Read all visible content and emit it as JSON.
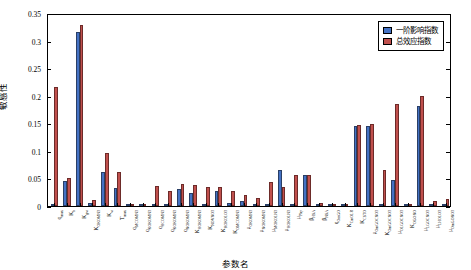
{
  "chart_data": {
    "type": "bar",
    "title": "",
    "xlabel": "参数名",
    "ylabel": "敏感性",
    "ylim": [
      0,
      0.35
    ],
    "yticks": [
      0,
      0.05,
      0.1,
      0.15,
      0.2,
      0.25,
      0.3,
      0.35
    ],
    "ytick_labels": [
      "0",
      "0.05",
      "0.1",
      "0.15",
      "0.2",
      "0.25",
      "0.3",
      "0.35"
    ],
    "grid": false,
    "legend_position": "top-right",
    "categories": [
      "q_max",
      "K_b",
      "K_gw",
      "K_OKOMN3",
      "K_w",
      "T_max",
      "q_MCOMN3",
      "q_KOKOMN3",
      "q_HCOMN3",
      "q_KOKOMN3b",
      "q_NOKOMN3",
      "K_HOKOMN3",
      "K_NOVNO3",
      "K_KOKOLO3",
      "K_OMCOMN3",
      "μ_OKOMN3",
      "μ_NOKOMN3",
      "μ_MOKOLN3",
      "μ_HOKOLN3",
      "μ_Phy",
      "β_HSA",
      "β_NSA",
      "q_OmGO",
      "K_CmOLR",
      "K_CSTO",
      "μ_OmGOCNO3",
      "K_OmGOCNO3",
      "μ_OLGOCNO3",
      "K_OGONO",
      "μ_LGOCNO3",
      "μ_LHOLO3",
      "μ_OmGONO3"
    ],
    "series": [
      {
        "name": "一阶影响指数",
        "color": "#4472C4",
        "values": [
          0.003,
          0.045,
          0.319,
          0.006,
          0.062,
          0.033,
          0.0,
          0.0,
          0.004,
          0.002,
          0.032,
          0.023,
          0.003,
          0.027,
          0.005,
          0.009,
          0.004,
          0.002,
          0.066,
          0.0,
          0.056,
          0.003,
          0.001,
          0.0,
          0.146,
          0.146,
          0.002,
          0.048,
          0.0,
          0.183,
          0.0,
          0.003
        ]
      },
      {
        "name": "总效应指数",
        "color": "#C0504D",
        "values": [
          0.219,
          0.052,
          0.331,
          0.011,
          0.098,
          0.062,
          0.001,
          0.001,
          0.036,
          0.027,
          0.041,
          0.039,
          0.034,
          0.034,
          0.028,
          0.021,
          0.015,
          0.044,
          0.034,
          0.056,
          0.057,
          0.005,
          0.003,
          0.002,
          0.148,
          0.15,
          0.066,
          0.187,
          0.002,
          0.202,
          0.01,
          0.013
        ]
      }
    ],
    "xtick_labels": [
      "q<sub>max</sub>",
      "K<sub>b</sub>",
      "K<sub>gw</sub>",
      "K<sub>OKOMN3</sub>",
      "K<sub>w</sub>",
      "T<sub>max</sub>",
      "q<sub>MCOMN3</sub>",
      "q<sub>KOKOMN3</sub>",
      "q<sub>HCOMN3</sub>",
      "q<sub>KOKOMN3</sub>",
      "q<sub>NOKOMN3</sub>",
      "K<sub>HOKOMN3</sub>",
      "K<sub>NOVNO3</sub>",
      "K<sub>KOKOLO3</sub>",
      "K<sub>OMCOMN3</sub>",
      "μ<sub>OKOMN3</sub>",
      "μ<sub>NOKOMN3</sub>",
      "μ<sub>MOKOLN3</sub>",
      "μ<sub>HOKOLN3</sub>",
      "μ<sub>Phy</sub>",
      "β<sub>HSA</sub>",
      "β<sub>NSA</sub>",
      "q<sub>OmGO</sub>",
      "K<sub>CmOLR</sub>",
      "K<sub>CSTO</sub>",
      "μ<sub>OmGOCNO3</sub>",
      "K<sub>OmGOCNO3</sub>",
      "μ<sub>OLGOCNO3</sub>",
      "K<sub>OGONO</sub>",
      "μ<sub>LGOCNO3</sub>",
      "μ<sub>LHOLO3</sub>",
      "μ<sub>OmGONO3</sub>"
    ]
  },
  "legend": {
    "items": [
      {
        "label": "一阶影响指数",
        "color": "#4472C4"
      },
      {
        "label": "总效应指数",
        "color": "#C0504D"
      }
    ]
  }
}
